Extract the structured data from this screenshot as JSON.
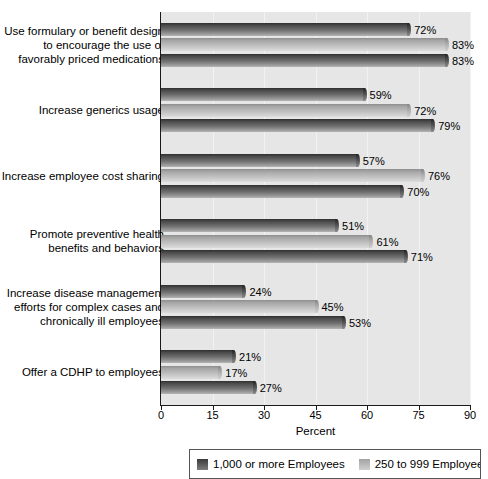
{
  "chart_data": {
    "type": "bar",
    "orientation": "horizontal",
    "title": "",
    "xlabel": "Percent",
    "ylabel": "",
    "xlim": [
      0,
      90
    ],
    "xticks": [
      0,
      15,
      30,
      45,
      60,
      75,
      90
    ],
    "xtick_labels": [
      "0",
      "15",
      "30",
      "45",
      "60",
      "75",
      "90"
    ],
    "grid": true,
    "legend_position": "bottom",
    "value_suffix": "%",
    "categories": [
      "Use formulary or benefit design to encourage the use of favorably priced medications",
      "Increase generics usage",
      "Increase employee cost sharing",
      "Promote preventive health benefits and behaviors",
      "Increase disease management efforts for complex cases and chronically ill employees",
      "Offer a CDHP to employees"
    ],
    "category_lines": [
      [
        "Use formulary or benefit design",
        "to encourage the use of",
        "favorably priced medications"
      ],
      [
        "Increase generics usage"
      ],
      [
        "Increase employee cost sharing"
      ],
      [
        "Promote preventive health",
        "benefits and behaviors"
      ],
      [
        "Increase disease management",
        "efforts for complex cases and",
        "chronically ill employees"
      ],
      [
        "Offer a CDHP to employees"
      ]
    ],
    "series": [
      {
        "name": "1,000 or more Employees",
        "style": "dark",
        "values": [
          72,
          59,
          57,
          51,
          24,
          21
        ],
        "labels": [
          "72%",
          "59%",
          "57%",
          "51%",
          "24%",
          "21%"
        ]
      },
      {
        "name": "250 to 999 Employees",
        "style": "light",
        "values": [
          83,
          72,
          76,
          61,
          45,
          17
        ],
        "labels": [
          "83%",
          "72%",
          "76%",
          "61%",
          "45%",
          "17%"
        ]
      },
      {
        "name": "",
        "style": "dark",
        "values": [
          83,
          79,
          70,
          71,
          53,
          27
        ],
        "labels": [
          "83%",
          "79%",
          "70%",
          "71%",
          "53%",
          "27%"
        ]
      }
    ]
  },
  "legend": {
    "entries": [
      {
        "label": "1,000 or more Employees",
        "style": "dark",
        "color": "#3a3a3a"
      },
      {
        "label": "250 to 999 Employees",
        "style": "light",
        "color": "#b4b4b4"
      }
    ]
  },
  "colors": {
    "plot_background": "#e6e6e6",
    "axis": "#1a1a1a",
    "series_dark": "#4a4a4a",
    "series_light": "#b9b9b9",
    "text": "#000000"
  }
}
